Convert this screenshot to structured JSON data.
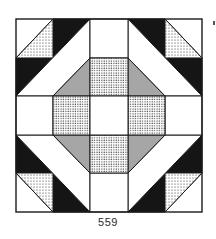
{
  "diagram": {
    "type": "quilt-block",
    "label": "559",
    "grid": {
      "rows": 5,
      "cols": 5
    },
    "colors": {
      "outline": "#1a1a1a",
      "dark": "#151515",
      "white": "#ffffff",
      "light_dots": "#ffffff",
      "dot_color": "#222222"
    }
  }
}
